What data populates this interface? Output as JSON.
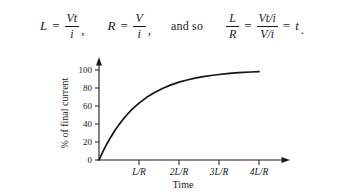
{
  "equation": {
    "term1": {
      "lhs": "L",
      "equals": "=",
      "numerator": "Vt",
      "denominator": "i",
      "trailing": ","
    },
    "term2": {
      "lhs": "R",
      "equals": "=",
      "numerator": "V",
      "denominator": "i",
      "trailing": ","
    },
    "connector": "and so",
    "term3": {
      "lhs_numerator": "L",
      "lhs_denominator": "R",
      "equals1": "=",
      "numerator": "Vt/i",
      "denominator": "V/i",
      "equals2": "=",
      "result": "t",
      "trailing": "."
    }
  },
  "chart_data": {
    "type": "line",
    "title": "",
    "xlabel": "Time",
    "ylabel": "% of final current",
    "x_tick_labels": [
      "L/R",
      "2L/R",
      "3L/R",
      "4L/R"
    ],
    "x_tick_values": [
      1,
      2,
      3,
      4
    ],
    "y_tick_labels": [
      "0",
      "20",
      "40",
      "60",
      "80",
      "100"
    ],
    "y_tick_values": [
      0,
      20,
      40,
      60,
      80,
      100
    ],
    "xlim": [
      0,
      4.4
    ],
    "ylim": [
      0,
      108
    ],
    "grid": false,
    "legend": false,
    "series": [
      {
        "name": "current rise",
        "formula": "100 * (1 - exp(-t))",
        "x": [
          0,
          0.1,
          0.2,
          0.3,
          0.4,
          0.5,
          0.6,
          0.7,
          0.8,
          0.9,
          1.0,
          1.2,
          1.4,
          1.6,
          1.8,
          2.0,
          2.2,
          2.4,
          2.6,
          2.8,
          3.0,
          3.2,
          3.4,
          3.6,
          3.8,
          4.0
        ],
        "values": [
          0,
          9.5,
          18.1,
          25.9,
          33.0,
          39.3,
          45.1,
          50.3,
          55.1,
          59.3,
          63.2,
          69.9,
          75.3,
          79.8,
          83.5,
          86.5,
          88.9,
          90.9,
          92.6,
          93.9,
          95.0,
          95.9,
          96.7,
          97.3,
          97.8,
          98.2
        ]
      }
    ]
  },
  "colors": {
    "ink": "#1a1a1a",
    "curve": "#151515",
    "background": "#fefefe"
  }
}
